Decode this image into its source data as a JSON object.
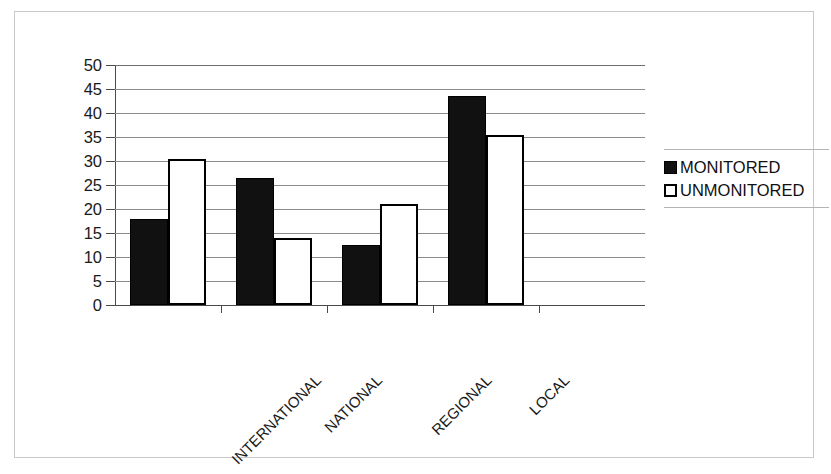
{
  "chart_data": {
    "type": "bar",
    "title": "",
    "subtitle": "",
    "xlabel": "",
    "ylabel": "",
    "categories": [
      "INTERNATIONAL",
      "NATIONAL",
      "REGIONAL",
      "LOCAL"
    ],
    "series": [
      {
        "name": "MONITORED",
        "values": [
          18,
          26.5,
          12.5,
          43.5
        ],
        "color": "#111111"
      },
      {
        "name": "UNMONITORED",
        "values": [
          30.5,
          14,
          21,
          35.5
        ],
        "color": "#ffffff"
      }
    ],
    "ylim": [
      0,
      50
    ],
    "ytick_step": 5,
    "yticks": [
      "0",
      "5",
      "10",
      "15",
      "20",
      "25",
      "30",
      "35",
      "40",
      "45",
      "50"
    ],
    "grid": "horizontal",
    "legend_position": "right",
    "xlabel_rotation": -45,
    "empty_trailing_category_slot": true,
    "annotations": []
  },
  "legend": {
    "items": [
      {
        "label": "MONITORED",
        "swatch": "filled-black-square"
      },
      {
        "label": "UNMONITORED",
        "swatch": "open-white-square"
      }
    ]
  },
  "colors": {
    "monitored": "#111111",
    "unmonitored": "#ffffff",
    "bar_outline": "#000000",
    "gridline": "#8c8c8c",
    "axis": "#4a4a4a",
    "frame": "#c9c9c9",
    "background": "#ffffff",
    "text": "#1a1a1a"
  }
}
